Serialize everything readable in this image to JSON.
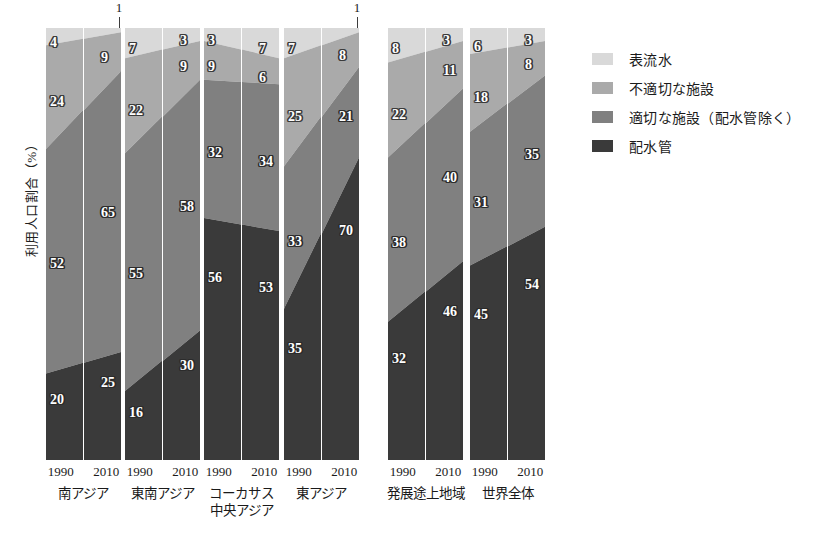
{
  "chart_data": {
    "type": "area",
    "title": "",
    "subtitle": "",
    "xlabel": "",
    "ylabel": "利用人口割合（%）",
    "ylim": [
      0,
      100
    ],
    "grid": false,
    "legend_position": "right",
    "stacking": "percent",
    "note_stack_order_top_to_bottom": [
      "表流水",
      "不適切な施設",
      "適切な施設（配水管除く）",
      "配水管"
    ],
    "categories": [
      "1990 南アジア",
      "2010 南アジア",
      "1990 東南アジア",
      "2010 東南アジア",
      "1990 コーカサス 中央アジア",
      "2010 コーカサス 中央アジア",
      "1990 東アジア",
      "2010 東アジア",
      "1990 発展途上地域",
      "2010 発展途上地域",
      "1990 世界全体",
      "2010 世界全体"
    ],
    "series": [
      {
        "name": "表流水",
        "color": "#d9d9d9",
        "values": [
          4,
          1,
          7,
          3,
          3,
          7,
          7,
          1,
          8,
          3,
          6,
          3
        ]
      },
      {
        "name": "不適切な施設",
        "color": "#aaaaaa",
        "values": [
          24,
          9,
          22,
          9,
          9,
          6,
          25,
          8,
          22,
          11,
          18,
          8
        ]
      },
      {
        "name": "適切な施設（配水管除く）",
        "color": "#808080",
        "values": [
          52,
          65,
          55,
          58,
          32,
          34,
          33,
          21,
          38,
          40,
          31,
          35
        ]
      },
      {
        "name": "配水管",
        "color": "#3a3a3a",
        "values": [
          20,
          25,
          16,
          30,
          56,
          53,
          35,
          70,
          32,
          46,
          45,
          54
        ]
      }
    ],
    "groups": [
      {
        "region": "南アジア",
        "region_lines": [
          "南アジア"
        ],
        "bars": [
          {
            "year": "1990",
            "values": {
              "表流水": 4,
              "不適切な施設": 24,
              "適切な施設（配水管除く）": 52,
              "配水管": 20
            }
          },
          {
            "year": "2010",
            "values": {
              "表流水": 1,
              "不適切な施設": 9,
              "適切な施設（配水管除く）": 65,
              "配水管": 25
            }
          }
        ]
      },
      {
        "region": "東南アジア",
        "region_lines": [
          "東南アジア"
        ],
        "bars": [
          {
            "year": "1990",
            "values": {
              "表流水": 7,
              "不適切な施設": 22,
              "適切な施設（配水管除く）": 55,
              "配水管": 16
            }
          },
          {
            "year": "2010",
            "values": {
              "表流水": 3,
              "不適切な施設": 9,
              "適切な施設（配水管除く）": 58,
              "配水管": 30
            }
          }
        ]
      },
      {
        "region": "コーカサス 中央アジア",
        "region_lines": [
          "コーカサス",
          "中央アジア"
        ],
        "bars": [
          {
            "year": "1990",
            "values": {
              "表流水": 3,
              "不適切な施設": 9,
              "適切な施設（配水管除く）": 32,
              "配水管": 56
            }
          },
          {
            "year": "2010",
            "values": {
              "表流水": 7,
              "不適切な施設": 6,
              "適切な施設（配水管除く）": 34,
              "配水管": 53
            }
          }
        ]
      },
      {
        "region": "東アジア",
        "region_lines": [
          "東アジア"
        ],
        "bars": [
          {
            "year": "1990",
            "values": {
              "表流水": 7,
              "不適切な施設": 25,
              "適切な施設（配水管除く）": 33,
              "配水管": 35
            }
          },
          {
            "year": "2010",
            "values": {
              "表流水": 1,
              "不適切な施設": 8,
              "適切な施設（配水管除く）": 21,
              "配水管": 70
            }
          }
        ]
      },
      {
        "region": "発展途上地域",
        "region_lines": [
          "発展途上地域"
        ],
        "bars": [
          {
            "year": "1990",
            "values": {
              "表流水": 8,
              "不適切な施設": 22,
              "適切な施設（配水管除く）": 38,
              "配水管": 32
            }
          },
          {
            "year": "2010",
            "values": {
              "表流水": 3,
              "不適切な施設": 11,
              "適切な施設（配水管除く）": 40,
              "配水管": 46
            }
          }
        ]
      },
      {
        "region": "世界全体",
        "region_lines": [
          "世界全体"
        ],
        "bars": [
          {
            "year": "1990",
            "values": {
              "表流水": 6,
              "不適切な施設": 18,
              "適切な施設（配水管除く）": 31,
              "配水管": 45
            }
          },
          {
            "year": "2010",
            "values": {
              "表流水": 3,
              "不適切な施設": 8,
              "適切な施設（配水管除く）": 35,
              "配水管": 54
            }
          }
        ]
      }
    ],
    "outside_labels": [
      {
        "group": 0,
        "bar": 1,
        "text": "1"
      },
      {
        "group": 3,
        "bar": 1,
        "text": "1"
      }
    ]
  },
  "legend": {
    "items": [
      {
        "label": "表流水",
        "color": "#d9d9d9"
      },
      {
        "label": "不適切な施設",
        "color": "#aaaaaa"
      },
      {
        "label": "適切な施設（配水管除く）",
        "color": "#808080"
      },
      {
        "label": "配水管",
        "color": "#3a3a3a"
      }
    ]
  },
  "axis": {
    "y_label": "利用人口割合（%）",
    "x_years": [
      "1990",
      "2010"
    ]
  }
}
